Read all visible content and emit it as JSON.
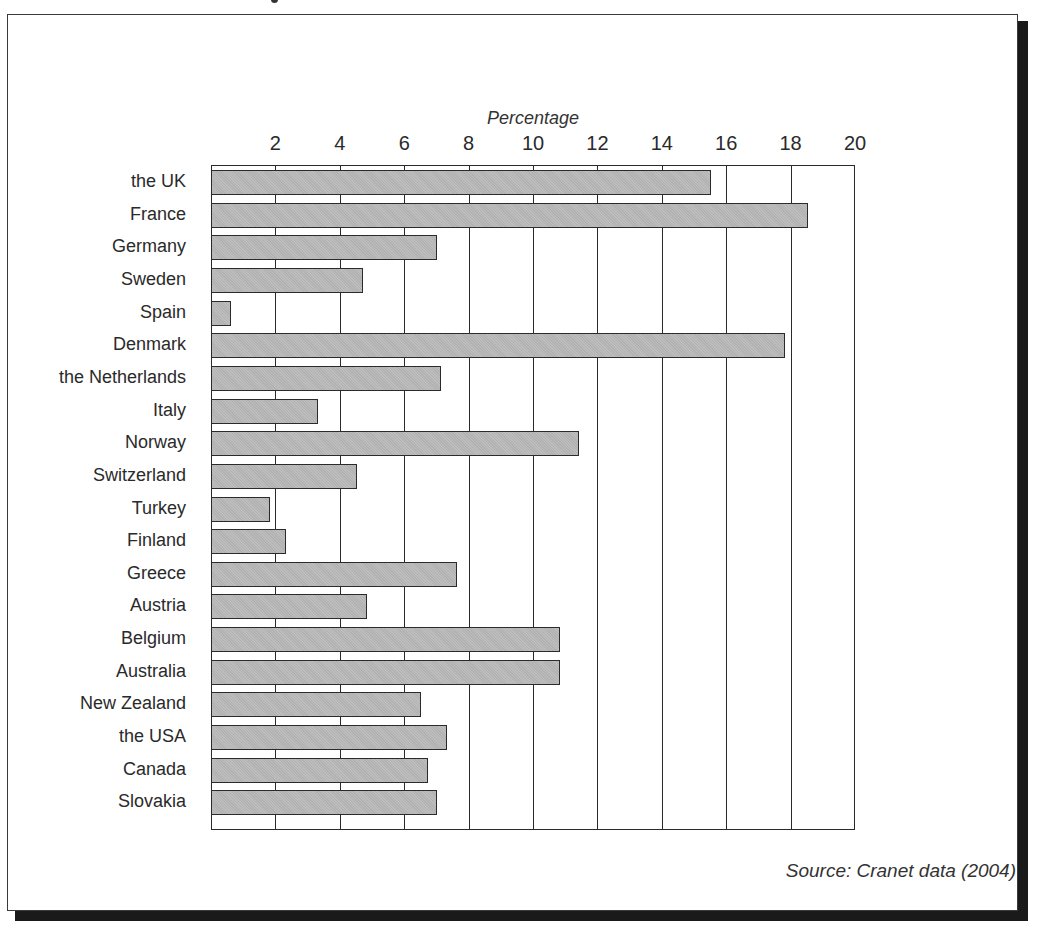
{
  "chart_data": {
    "type": "bar",
    "orientation": "horizontal",
    "title": "",
    "xlabel": "Percentage",
    "ylabel": "",
    "xlim": [
      0,
      20
    ],
    "xticks": [
      2,
      4,
      6,
      8,
      10,
      12,
      14,
      16,
      18,
      20
    ],
    "grid": true,
    "legend": null,
    "categories": [
      "the UK",
      "France",
      "Germany",
      "Sweden",
      "Spain",
      "Denmark",
      "the Netherlands",
      "Italy",
      "Norway",
      "Switzerland",
      "Turkey",
      "Finland",
      "Greece",
      "Austria",
      "Belgium",
      "Australia",
      "New Zealand",
      "the USA",
      "Canada",
      "Slovakia"
    ],
    "values": [
      15.5,
      18.5,
      7.0,
      4.7,
      0.6,
      17.8,
      7.1,
      3.3,
      11.4,
      4.5,
      1.8,
      2.3,
      7.6,
      4.8,
      10.8,
      10.8,
      6.5,
      7.3,
      6.7,
      7.0
    ],
    "annotations": [
      "Source: Cranet data (2004)"
    ],
    "bar_color": "#b8b8b8"
  },
  "axis": {
    "title": "Percentage",
    "ticks": [
      "2",
      "4",
      "6",
      "8",
      "10",
      "12",
      "14",
      "16",
      "18",
      "20"
    ]
  },
  "source": "Source: Cranet data (2004)"
}
